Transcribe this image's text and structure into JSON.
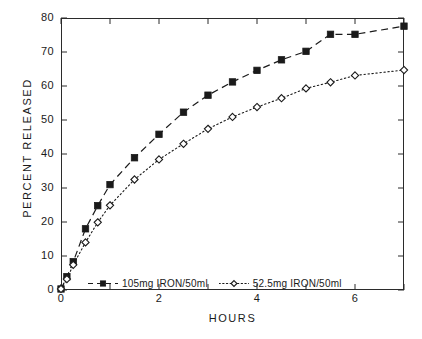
{
  "chart_data": {
    "type": "line",
    "title": "",
    "xlabel": "HOURS",
    "ylabel": "PERCENT RELEASED",
    "xlim": [
      0,
      7
    ],
    "ylim": [
      0,
      80
    ],
    "grid": false,
    "legend_position": "bottom-center-inside",
    "xticks": [
      0,
      2,
      4,
      6
    ],
    "xtick_labels": [
      "0",
      "2",
      "4",
      "6"
    ],
    "xminor_ticks": [
      1,
      3,
      5,
      7
    ],
    "yticks": [
      0,
      10,
      20,
      30,
      40,
      50,
      60,
      70,
      80
    ],
    "ytick_labels": [
      "0",
      "10",
      "20",
      "30",
      "40",
      "50",
      "60",
      "70",
      "80"
    ],
    "x": [
      0,
      0.12,
      0.25,
      0.5,
      0.75,
      1,
      1.5,
      2,
      2.5,
      3,
      3.5,
      4,
      4.5,
      5,
      5.5,
      6,
      7
    ],
    "series": [
      {
        "name": "105mg  IRON/50ml",
        "marker": "filled-square",
        "linestyle": "dashed",
        "color": "#1a1a1a",
        "values": [
          0.3,
          3.9,
          8.3,
          18.0,
          24.8,
          31.0,
          38.9,
          45.8,
          52.3,
          57.3,
          61.2,
          64.6,
          67.7,
          70.2,
          75.2,
          75.2,
          77.6
        ]
      },
      {
        "name": "52.5mg  IRON/50ml",
        "marker": "open-diamond",
        "linestyle": "dotted",
        "color": "#1a1a1a",
        "values": [
          0.3,
          3.2,
          7.4,
          14.0,
          19.9,
          24.9,
          32.5,
          38.4,
          43.0,
          47.4,
          50.9,
          53.8,
          56.4,
          59.3,
          61.1,
          63.1,
          64.7
        ]
      }
    ]
  }
}
